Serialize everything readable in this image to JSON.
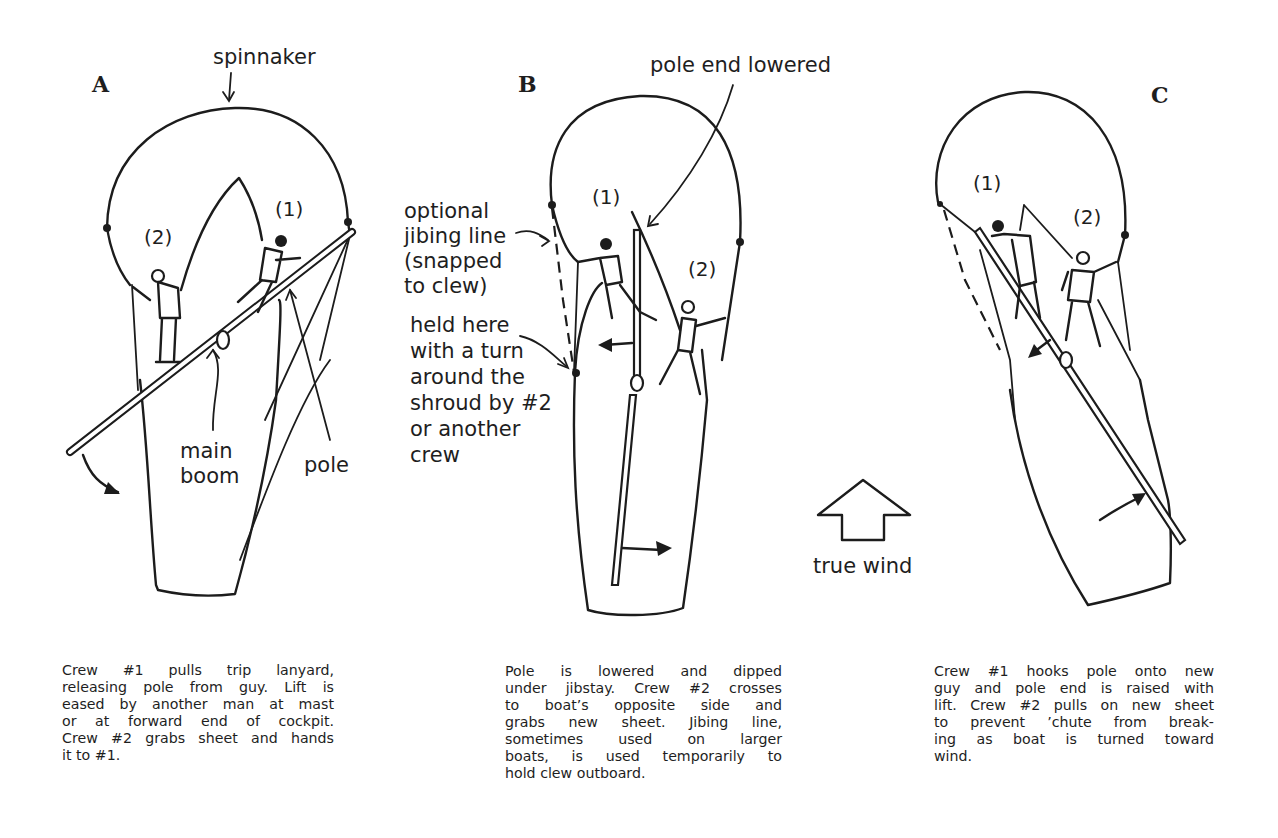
{
  "figure": {
    "panels": [
      {
        "id": "A",
        "letter": "A",
        "labels": {
          "spinnaker": "spinnaker",
          "crew1": "(1)",
          "crew2": "(2)",
          "main_boom_1": "main",
          "main_boom_2": "boom",
          "pole": "pole"
        },
        "caption_lines": [
          "Crew #1 pulls trip lanyard,",
          "releasing pole from guy. Lift is",
          "eased by another man at mast",
          "or at forward end of cockpit.",
          "Crew #2 grabs sheet and hands",
          "it to #1."
        ]
      },
      {
        "id": "B",
        "letter": "B",
        "labels": {
          "pole_end_lowered": "pole end lowered",
          "crew1": "(1)",
          "crew2": "(2)",
          "jibing_line": [
            "optional",
            "jibing line",
            "(snapped",
            "to clew)"
          ],
          "held_here": [
            "held here",
            "with a turn",
            "around the",
            "shroud by #2",
            "or another",
            "crew"
          ]
        },
        "caption_lines": [
          "Pole is lowered and dipped",
          "under jibstay. Crew #2 crosses",
          "to boat’s opposite side and",
          "grabs new sheet. Jibing line,",
          "sometimes used on larger",
          "boats, is used temporarily to",
          "hold clew outboard."
        ]
      },
      {
        "id": "C",
        "letter": "C",
        "labels": {
          "crew1": "(1)",
          "crew2": "(2)"
        },
        "caption_lines": [
          "Crew #1 hooks pole onto new",
          "guy and pole end is raised with",
          "lift. Crew #2 pulls on new sheet",
          "to prevent ’chute from break-",
          "ing as boat is turned toward",
          "wind."
        ]
      }
    ],
    "wind_indicator": {
      "icon": "hollow-up-arrow-icon",
      "label": "true wind"
    },
    "colors": {
      "ink": "#1c1c1c",
      "paper": "#ffffff"
    }
  }
}
